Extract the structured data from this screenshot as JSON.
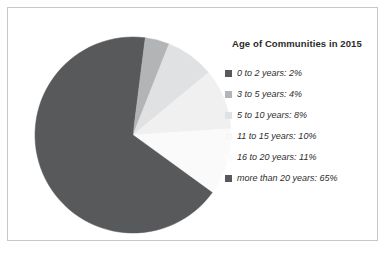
{
  "chart_data": {
    "type": "pie",
    "title": "Age of Communities in 2015",
    "xlabel": "",
    "ylabel": "",
    "legend_position": "right",
    "start_angle_deg": 0,
    "direction": "clockwise",
    "categories": [
      "0 to 2 years",
      "3 to 5 years",
      "5 to 10 years",
      "11 to 15 years",
      "16 to 20 years",
      "more than 20 years"
    ],
    "values": [
      2,
      4,
      8,
      10,
      11,
      65
    ],
    "value_unit": "%",
    "colors": [
      "#58595b",
      "#b3b4b6",
      "#e0e1e2",
      "#f0f0f0",
      "#fafafa",
      "#58595b"
    ],
    "legend_entries": [
      {
        "label": "0 to 2 years: 2%",
        "color": "#58595b",
        "value": 2
      },
      {
        "label": "3 to 5 years: 4%",
        "color": "#b3b4b6",
        "value": 4
      },
      {
        "label": "5 to 10 years: 8%",
        "color": "#e0e1e2",
        "value": 8
      },
      {
        "label": "11 to 15 years: 10%",
        "color": "#f7f7f7",
        "value": 10
      },
      {
        "label": "16 to 20 years: 11%",
        "color": "#fcfcfc",
        "value": 11
      },
      {
        "label": "more than 20 years: 65%",
        "color": "#58595b",
        "value": 65
      }
    ]
  },
  "frame": {
    "border_color": "#c9c9c9",
    "background": "#ffffff"
  }
}
